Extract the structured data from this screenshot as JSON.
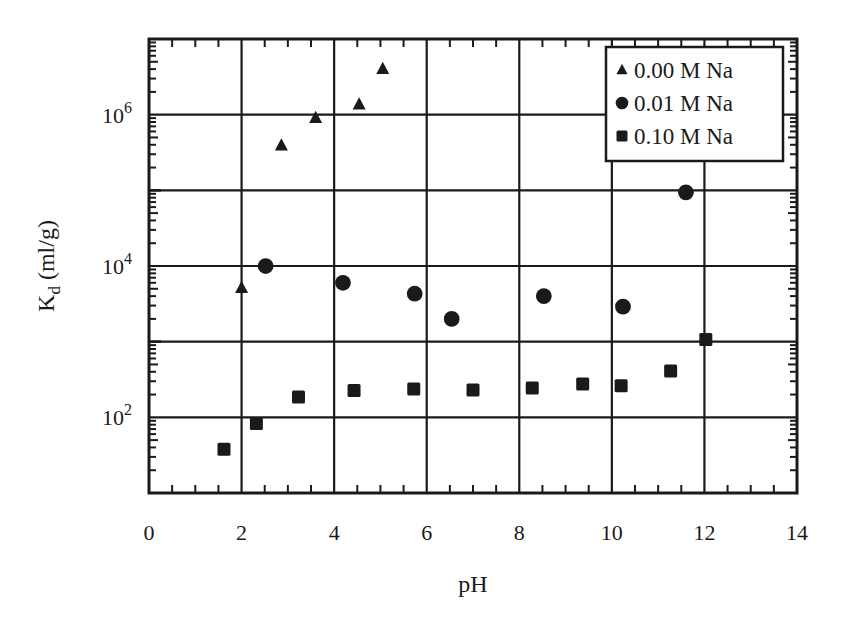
{
  "chart_data": {
    "type": "scatter",
    "title": "",
    "xlabel": "pH",
    "ylabel": "K_d (ml/g)",
    "ylabel_main": "K",
    "ylabel_sub": "d",
    "ylabel_rest": " (ml/g)",
    "x_scale": "linear",
    "y_scale": "log",
    "xlim": [
      0,
      14
    ],
    "ylim": [
      10,
      10000000
    ],
    "x_ticks": [
      0,
      2,
      4,
      6,
      8,
      10,
      12,
      14
    ],
    "x_tick_labels": [
      "0",
      "2",
      "4",
      "6",
      "8",
      "10",
      "12",
      "14"
    ],
    "y_ticks": [
      100,
      10000,
      1000000
    ],
    "y_tick_labels": [
      {
        "base": "10",
        "exp": "2",
        "value": 100
      },
      {
        "base": "10",
        "exp": "4",
        "value": 10000
      },
      {
        "base": "10",
        "exp": "6",
        "value": 1000000
      }
    ],
    "grid": true,
    "grid_x": [
      2,
      4,
      6,
      8,
      10,
      12
    ],
    "grid_y_decades": [
      100,
      1000,
      10000,
      100000,
      1000000
    ],
    "legend_position": "upper right",
    "series": [
      {
        "name": "0.00 M Na",
        "marker": "triangle",
        "color": "#1a1a1a",
        "points": [
          {
            "x": 2.0,
            "y": 5100
          },
          {
            "x": 2.86,
            "y": 390000
          },
          {
            "x": 3.6,
            "y": 900000
          },
          {
            "x": 4.54,
            "y": 1360000
          },
          {
            "x": 5.05,
            "y": 4000000
          }
        ]
      },
      {
        "name": "0.01 M Na",
        "marker": "circle",
        "color": "#1a1a1a",
        "points": [
          {
            "x": 2.52,
            "y": 10000
          },
          {
            "x": 4.19,
            "y": 6000
          },
          {
            "x": 5.74,
            "y": 4300
          },
          {
            "x": 6.54,
            "y": 2000
          },
          {
            "x": 8.53,
            "y": 4000
          },
          {
            "x": 10.24,
            "y": 2900
          },
          {
            "x": 11.6,
            "y": 94000
          }
        ]
      },
      {
        "name": "0.10 M Na",
        "marker": "square",
        "color": "#1a1a1a",
        "points": [
          {
            "x": 1.62,
            "y": 38
          },
          {
            "x": 2.32,
            "y": 83
          },
          {
            "x": 3.23,
            "y": 186
          },
          {
            "x": 4.43,
            "y": 226
          },
          {
            "x": 5.72,
            "y": 236
          },
          {
            "x": 7.0,
            "y": 230
          },
          {
            "x": 8.28,
            "y": 245
          },
          {
            "x": 9.37,
            "y": 275
          },
          {
            "x": 10.2,
            "y": 262
          },
          {
            "x": 11.27,
            "y": 410
          },
          {
            "x": 12.03,
            "y": 1070
          }
        ]
      }
    ]
  },
  "layout": {
    "plot": {
      "left": 149,
      "right": 797,
      "top": 39,
      "bottom": 493
    },
    "legend": {
      "x": 606,
      "y": 47,
      "w": 177,
      "h": 114
    }
  }
}
